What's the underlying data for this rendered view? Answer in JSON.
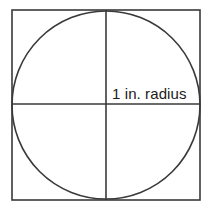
{
  "figure": {
    "name": "circle-inscribed-in-square",
    "background_color": "#ffffff",
    "stroke_color": "#3a3a3a",
    "text_color": "#1a1a1a",
    "label": "1 in. radius",
    "square": {
      "x": 12,
      "y": 10,
      "width": 188,
      "height": 190,
      "stroke_width": 1.6
    },
    "circle": {
      "cx": 106,
      "cy": 105,
      "r": 94,
      "stroke_width": 1.6
    },
    "vertical_axis": {
      "x": 106,
      "y1": 10,
      "y2": 200,
      "stroke_width": 1.6
    },
    "horizontal_axis": {
      "y": 104,
      "x1": 12,
      "x2": 200,
      "stroke_width": 1.6
    },
    "label_position": {
      "x": 112,
      "y": 99
    }
  }
}
